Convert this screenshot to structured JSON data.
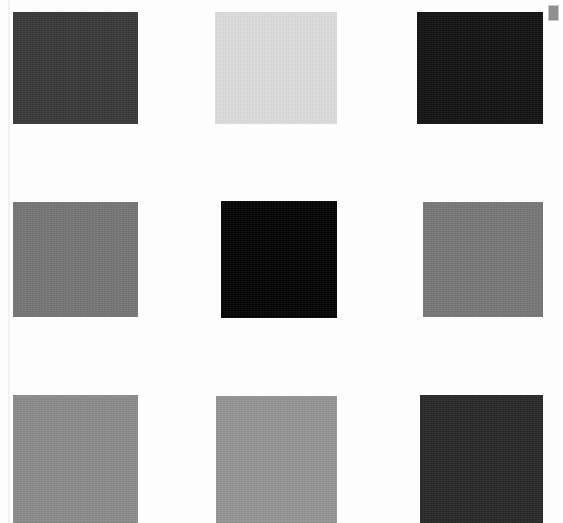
{
  "page": {
    "background_color": "#fdfdfd",
    "width": 563,
    "height": 523
  },
  "corner_marker": {
    "name": "page-corner-marker",
    "label": "",
    "color": "#8f8f8f"
  },
  "grid": {
    "rows": 3,
    "columns": 3,
    "swatch_width": 125,
    "swatch_height": 112,
    "column_x": [
      13,
      215,
      417
    ],
    "row_y": [
      12,
      202,
      395
    ],
    "swatches": [
      {
        "id": "swatch-r1c1",
        "row": 1,
        "column": 1,
        "color": "#3a3a3a",
        "label": "dark-gray",
        "x": 13,
        "y": 12,
        "width": 125,
        "height": 112
      },
      {
        "id": "swatch-r1c2",
        "row": 1,
        "column": 2,
        "color": "#dcdcdc",
        "label": "very-light-gray",
        "x": 215,
        "y": 12,
        "width": 122,
        "height": 112
      },
      {
        "id": "swatch-r1c3",
        "row": 1,
        "column": 3,
        "color": "#141414",
        "label": "near-black",
        "x": 417,
        "y": 12,
        "width": 126,
        "height": 112
      },
      {
        "id": "swatch-r2c1",
        "row": 2,
        "column": 1,
        "color": "#767676",
        "label": "medium-gray",
        "x": 13,
        "y": 202,
        "width": 125,
        "height": 115
      },
      {
        "id": "swatch-r2c2",
        "row": 2,
        "column": 2,
        "color": "#050505",
        "label": "black",
        "x": 221,
        "y": 201,
        "width": 116,
        "height": 117
      },
      {
        "id": "swatch-r2c3",
        "row": 2,
        "column": 3,
        "color": "#787878",
        "label": "medium-gray",
        "x": 423,
        "y": 202,
        "width": 120,
        "height": 115
      },
      {
        "id": "swatch-r3c1",
        "row": 3,
        "column": 1,
        "color": "#8c8c8c",
        "label": "light-medium-gray",
        "x": 13,
        "y": 395,
        "width": 125,
        "height": 128
      },
      {
        "id": "swatch-r3c2",
        "row": 3,
        "column": 2,
        "color": "#959595",
        "label": "light-medium-gray",
        "x": 216,
        "y": 396,
        "width": 121,
        "height": 127
      },
      {
        "id": "swatch-r3c3",
        "row": 3,
        "column": 3,
        "color": "#2a2a2a",
        "label": "very-dark-gray",
        "x": 420,
        "y": 395,
        "width": 123,
        "height": 128
      }
    ]
  }
}
